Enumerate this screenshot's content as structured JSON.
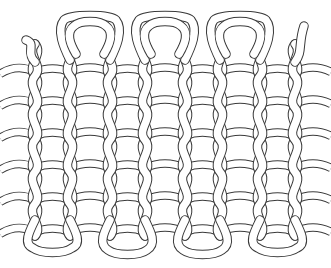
{
  "figure": {
    "style": "black outline line-art on white",
    "colors": {
      "outline": "#3a3a3a",
      "fill": "#ffffff",
      "background": "#ffffff"
    },
    "wale_x": [
      35,
      70,
      110,
      145,
      185,
      220,
      260,
      295
    ],
    "course_y": [
      68,
      100,
      132,
      164,
      196,
      228
    ],
    "top_loops": [
      {
        "left": 70,
        "right": 110,
        "top": 14
      },
      {
        "left": 145,
        "right": 185,
        "top": 14
      },
      {
        "left": 220,
        "right": 260,
        "top": 14
      }
    ],
    "bottom_loops": [
      {
        "left": 35,
        "right": 70,
        "bottom": 252
      },
      {
        "left": 110,
        "right": 145,
        "bottom": 254
      },
      {
        "left": 185,
        "right": 220,
        "bottom": 254
      },
      {
        "left": 260,
        "right": 295,
        "bottom": 252
      }
    ],
    "loose_ends": [
      {
        "side": "top-left",
        "x": 30,
        "y": 40
      },
      {
        "side": "top-right",
        "x": 300,
        "y": 40
      }
    ]
  }
}
